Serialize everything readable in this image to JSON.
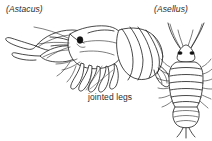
{
  "figure": {
    "background_color": "#ffffff",
    "ink_color": "#1b1b1b",
    "text_color": "#2b2b2b",
    "leader_color": "#4a4a4a"
  },
  "labels": {
    "left_specimen": "(Astacus)",
    "right_specimen": "(Asellus)"
  },
  "annotations": {
    "jointed_legs": "jointed legs"
  },
  "specimens": [
    {
      "name_label": "(Astacus)",
      "common_name": "crayfish",
      "view": "lateral",
      "features": [
        "chelipeds",
        "carapace",
        "segmented abdomen",
        "tail fan",
        "walking legs",
        "eye"
      ]
    },
    {
      "name_label": "(Asellus)",
      "common_name": "water louse",
      "view": "dorsal",
      "features": [
        "antennae",
        "eyes",
        "segmented body",
        "lateral legs",
        "pleotelson",
        "uropods"
      ]
    }
  ]
}
